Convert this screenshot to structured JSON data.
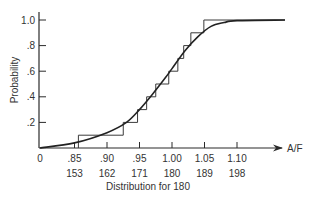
{
  "chart_data": {
    "type": "line",
    "title": "",
    "xlabel": "A/F",
    "xlabel_secondary": "Distribution for 180",
    "ylabel": "Probability",
    "xlim": [
      0.8,
      1.16
    ],
    "ylim": [
      0,
      1.0
    ],
    "grid": false,
    "legend": null,
    "x_ticks": [
      {
        "value": 0.85,
        "label": ".85",
        "sub_label": "153"
      },
      {
        "value": 0.9,
        "label": ".90",
        "sub_label": "162"
      },
      {
        "value": 0.95,
        "label": ".95",
        "sub_label": "171"
      },
      {
        "value": 1.0,
        "label": "1.00",
        "sub_label": "180"
      },
      {
        "value": 1.05,
        "label": "1.05",
        "sub_label": "189"
      },
      {
        "value": 1.1,
        "label": "1.10",
        "sub_label": "198"
      }
    ],
    "origin_label": "0",
    "y_ticks": [
      {
        "value": 0.2,
        "label": ".2"
      },
      {
        "value": 0.4,
        "label": ".4"
      },
      {
        "value": 0.6,
        "label": ".6"
      },
      {
        "value": 0.8,
        "label": ".8"
      },
      {
        "value": 1.0,
        "label": "1.0"
      }
    ],
    "series": [
      {
        "name": "Empirical step distribution",
        "style": "step",
        "x": [
          0.856,
          0.925,
          0.947,
          0.961,
          0.975,
          0.995,
          1.009,
          1.018,
          1.029,
          1.049
        ],
        "y": [
          0.1,
          0.2,
          0.3,
          0.4,
          0.5,
          0.6,
          0.7,
          0.8,
          0.9,
          1.0
        ]
      },
      {
        "name": "Fitted cumulative curve",
        "style": "smooth",
        "x": [
          0.8,
          0.85,
          0.9,
          0.93,
          0.95,
          0.97,
          0.99,
          1.0,
          1.02,
          1.04,
          1.06,
          1.08,
          1.1,
          1.13
        ],
        "y": [
          0.0,
          0.04,
          0.12,
          0.2,
          0.3,
          0.42,
          0.55,
          0.62,
          0.76,
          0.87,
          0.95,
          0.98,
          0.995,
          1.0
        ]
      }
    ]
  }
}
